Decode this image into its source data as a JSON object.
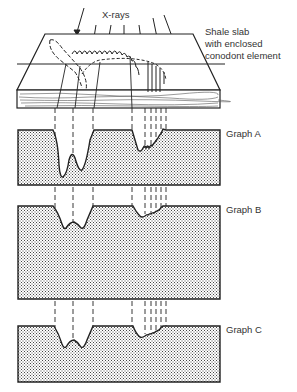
{
  "figure": {
    "xray_label": "X-rays",
    "slab_label_lines": [
      "Shale slab",
      "with enclosed",
      "conodont element"
    ],
    "graphs": [
      {
        "id": "A",
        "label": "Graph A"
      },
      {
        "id": "B",
        "label": "Graph B"
      },
      {
        "id": "C",
        "label": "Graph C"
      }
    ]
  },
  "colors": {
    "ink": "#222222",
    "stipple": "#555555",
    "background": "#ffffff"
  }
}
